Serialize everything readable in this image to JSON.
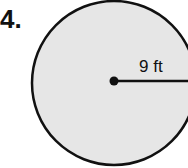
{
  "problem": {
    "number": "4.",
    "shape": "circle",
    "radius_label": "9 ft",
    "fill_color": "#e4e4e4",
    "stroke_color": "#111111"
  }
}
